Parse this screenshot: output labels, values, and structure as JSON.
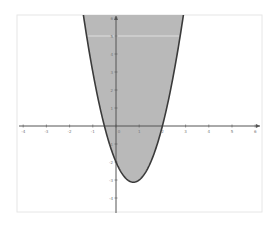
{
  "chart_data": {
    "type": "area",
    "title": "",
    "xlabel": "",
    "ylabel": "",
    "function": "y = 2x^2 - 3x - 2",
    "roots": [
      -0.5,
      2
    ],
    "vertex": [
      0.75,
      -3.125
    ],
    "y_intercept": -2,
    "xlim": [
      -4.2,
      6.3
    ],
    "ylim": [
      -4.7,
      6.2
    ],
    "x_ticks": [
      -4,
      -3,
      -2,
      -1,
      0,
      1,
      2,
      3,
      4,
      5,
      6
    ],
    "y_ticks": [
      -4,
      -3,
      -2,
      -1,
      1,
      2,
      3,
      4,
      5,
      6
    ],
    "x": [
      -1.41,
      -1,
      -0.5,
      0,
      0.5,
      0.75,
      1,
      1.5,
      2,
      2.5,
      2.91
    ],
    "y": [
      6.2,
      3,
      0,
      -2,
      -3,
      -3.125,
      -3,
      -2,
      0,
      3,
      6.2
    ],
    "grid": false,
    "legend": null,
    "colors": {
      "fill": "#b9b9b9",
      "curve": "#3a3a3a",
      "axis": "#555555",
      "frame": "#e6e6e6"
    }
  }
}
